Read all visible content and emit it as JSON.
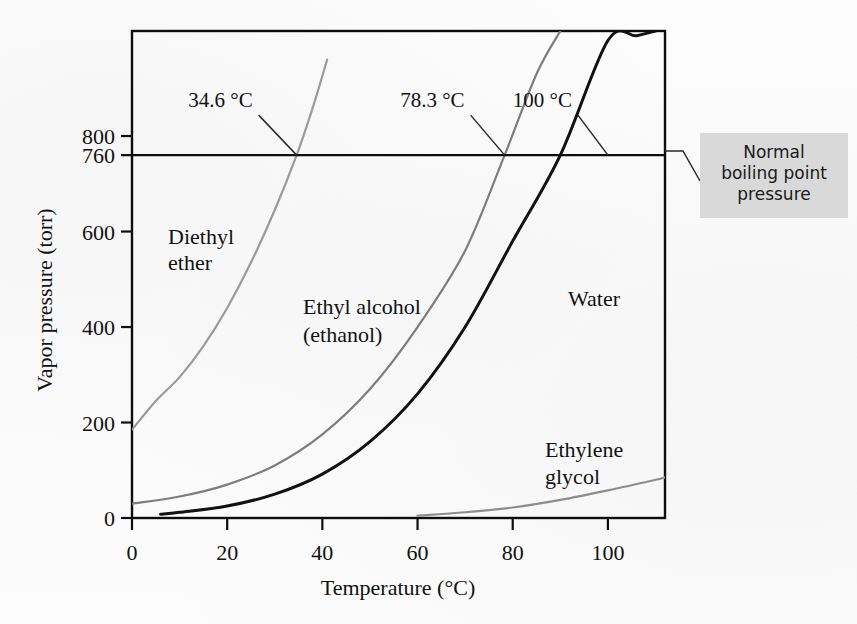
{
  "figure": {
    "background_color": "#ffffff"
  },
  "axes": {
    "x": {
      "label": "Temperature (°C)",
      "ticks": [
        "0",
        "20",
        "40",
        "60",
        "80",
        "100"
      ],
      "tick_values": [
        0,
        20,
        40,
        60,
        80,
        100
      ],
      "range": [
        0,
        112
      ]
    },
    "y": {
      "label": "Vapor pressure (torr)",
      "ticks": [
        "0",
        "200",
        "400",
        "600",
        "760",
        "800"
      ],
      "tick_values": [
        0,
        200,
        400,
        600,
        760,
        800
      ],
      "range": [
        0,
        1020
      ]
    }
  },
  "callout": {
    "lines": [
      "Normal",
      "boiling point",
      "pressure"
    ],
    "background_color": "#d9d9d9",
    "text_color": "#1a1a1a"
  },
  "boiling_points": [
    {
      "label": "34.6 °C",
      "temperature": 34.6,
      "substance": "Diethyl ether"
    },
    {
      "label": "78.3 °C",
      "temperature": 78.3,
      "substance": "Ethyl alcohol (ethanol)"
    },
    {
      "label": "100 °C",
      "temperature": 100,
      "substance": "Water"
    }
  ],
  "curve_labels": {
    "diethyl_ether": [
      "Diethyl",
      "ether"
    ],
    "ethanol": [
      "Ethyl alcohol",
      "(ethanol)"
    ],
    "water": [
      "Water"
    ],
    "ethylene_glycol": [
      "Ethylene",
      "glycol"
    ]
  },
  "chart_data": {
    "type": "line",
    "xlabel": "Temperature (°C)",
    "ylabel": "Vapor pressure (torr)",
    "xlim": [
      0,
      112
    ],
    "ylim": [
      0,
      1020
    ],
    "xticks": [
      0,
      20,
      40,
      60,
      80,
      100
    ],
    "yticks": [
      0,
      200,
      400,
      600,
      760,
      800
    ],
    "grid": false,
    "legend": "inline-curve-labels",
    "reference_line": {
      "name": "Normal boiling point pressure",
      "y": 760,
      "color": "#0d0d0d"
    },
    "annotations": [
      {
        "text": "34.6 °C",
        "x": 34.6,
        "y": 760
      },
      {
        "text": "78.3 °C",
        "x": 78.3,
        "y": 760
      },
      {
        "text": "100 °C",
        "x": 100,
        "y": 760
      },
      {
        "text": "Normal boiling point pressure",
        "x": 112,
        "y": 760
      }
    ],
    "series": [
      {
        "name": "Diethyl ether",
        "color": "#9a9a9a",
        "width": 2.2,
        "x": [
          0,
          5,
          10,
          15,
          20,
          25,
          30,
          34.6,
          38,
          41
        ],
        "y": [
          185,
          245,
          295,
          360,
          440,
          535,
          645,
          760,
          860,
          960
        ]
      },
      {
        "name": "Ethyl alcohol (ethanol)",
        "color": "#7d7d7d",
        "width": 2.2,
        "x": [
          0,
          10,
          20,
          30,
          40,
          50,
          60,
          70,
          78.3,
          85,
          90
        ],
        "y": [
          30,
          45,
          70,
          110,
          175,
          270,
          400,
          560,
          760,
          930,
          1020
        ]
      },
      {
        "name": "Water",
        "color": "#111111",
        "width": 3.0,
        "x": [
          6,
          10,
          20,
          30,
          40,
          50,
          60,
          70,
          80,
          90,
          100,
          106,
          110
        ],
        "y": [
          8,
          12,
          25,
          50,
          92,
          160,
          260,
          400,
          580,
          760,
          1000,
          1010,
          1020
        ]
      },
      {
        "name": "Ethylene glycol",
        "color": "#8d8d8d",
        "width": 2.2,
        "x": [
          60,
          70,
          80,
          90,
          100,
          110,
          112
        ],
        "y": [
          5,
          12,
          22,
          38,
          58,
          80,
          85
        ]
      }
    ]
  }
}
